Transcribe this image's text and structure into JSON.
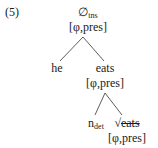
{
  "example_number": "(5)",
  "tree": {
    "root": {
      "head": "∅",
      "sub": "tns",
      "features": "[φ,pres]"
    },
    "left_child": {
      "word": "he"
    },
    "right_child": {
      "word": "eats",
      "features": "[φ,pres]",
      "left_child": {
        "head": "n",
        "sub": "det"
      },
      "right_child": {
        "root_symbol": "√",
        "word": "eats",
        "struck": true,
        "features": "[φ,pres]"
      }
    }
  }
}
